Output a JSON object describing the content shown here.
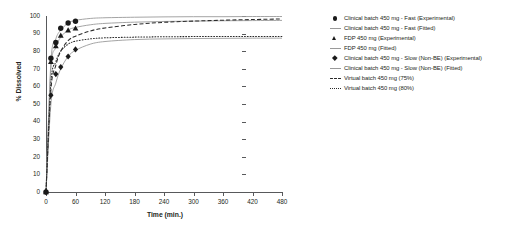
{
  "chart_data": {
    "type": "line",
    "title": "",
    "xlabel": "Time (min.)",
    "ylabel": "% Dissolved",
    "xlim": [
      0,
      480
    ],
    "ylim": [
      0,
      100
    ],
    "xticks": [
      0,
      60,
      120,
      180,
      240,
      300,
      360,
      420,
      480
    ],
    "yticks": [
      0,
      10,
      20,
      30,
      40,
      50,
      60,
      70,
      80,
      90,
      100
    ],
    "grid": false,
    "legend_position": "right",
    "series": [
      {
        "name": "Clinical batch 450 mg - Fast (Experimental)",
        "marker": "circle",
        "style": "markers",
        "color": "#1a1a1a",
        "x": [
          0,
          10,
          20,
          30,
          45,
          60
        ],
        "y": [
          0,
          76,
          85,
          93,
          96,
          97
        ]
      },
      {
        "name": "Clinical batch 450 mg - Fast (Fitted)",
        "marker": "none",
        "style": "solid",
        "color": "#9a9a9a",
        "x": [
          0,
          10,
          20,
          30,
          45,
          60,
          90,
          120,
          180,
          240,
          300,
          360,
          420,
          480
        ],
        "y": [
          0,
          74,
          87,
          92,
          96,
          97.5,
          98.6,
          99,
          99.3,
          99.5,
          99.6,
          99.6,
          99.7,
          99.7
        ]
      },
      {
        "name": "FDP 450 mg (Experimental)",
        "marker": "triangle",
        "style": "markers",
        "color": "#1a1a1a",
        "x": [
          0,
          10,
          20,
          30,
          45,
          60
        ],
        "y": [
          0,
          74,
          83,
          89,
          92,
          93
        ]
      },
      {
        "name": "FDP 450 mg (Fitted)",
        "marker": "none",
        "style": "solid",
        "color": "#9a9a9a",
        "x": [
          0,
          10,
          20,
          30,
          45,
          60,
          90,
          120,
          180,
          240,
          300,
          360,
          420,
          480
        ],
        "y": [
          0,
          70,
          82,
          88,
          92,
          93.5,
          95,
          95.8,
          96.5,
          96.9,
          97.1,
          97.3,
          97.4,
          97.5
        ]
      },
      {
        "name": "Clinical batch 450 mg - Slow (Non-BE) (Experimental)",
        "marker": "diamond",
        "style": "markers",
        "color": "#1a1a1a",
        "x": [
          0,
          10,
          20,
          30,
          45,
          60
        ],
        "y": [
          0,
          55,
          67,
          71,
          77,
          81
        ]
      },
      {
        "name": "Clinical batch 450 mg - Slow (Non-BE) (Fitted)",
        "marker": "none",
        "style": "solid",
        "color": "#9a9a9a",
        "x": [
          0,
          10,
          20,
          30,
          45,
          60,
          90,
          120,
          180,
          240,
          300,
          360,
          420,
          480
        ],
        "y": [
          0,
          50,
          62,
          70,
          77,
          80.5,
          84,
          85.5,
          86.6,
          87,
          87.2,
          87.3,
          87.4,
          87.4
        ]
      },
      {
        "name": "Virtual batch 450 mg (75%)",
        "marker": "none",
        "style": "dashed",
        "color": "#2b2b2b",
        "x": [
          0,
          10,
          20,
          30,
          45,
          60,
          90,
          120,
          180,
          240,
          300,
          360,
          420,
          480
        ],
        "y": [
          0,
          58,
          72,
          80,
          86,
          88.5,
          91.5,
          93.2,
          95.2,
          96.4,
          97.1,
          97.6,
          98,
          98.3
        ]
      },
      {
        "name": "Virtual batch 450 mg (80%)",
        "marker": "none",
        "style": "dotted",
        "color": "#2b2b2b",
        "x": [
          0,
          10,
          20,
          30,
          45,
          60,
          90,
          120,
          180,
          240,
          300,
          360,
          420,
          480
        ],
        "y": [
          0,
          62,
          74,
          80,
          84,
          85.7,
          87,
          87.6,
          88,
          88.2,
          88.3,
          88.3,
          88.4,
          88.4
        ]
      }
    ]
  },
  "legend": {
    "items": [
      {
        "key": "circle",
        "label": "Clinical batch 450 mg - Fast (Experimental)"
      },
      {
        "key": "solid",
        "label": "Clinical batch 450 mg - Fast (Fitted)"
      },
      {
        "key": "triangle",
        "label": "FDP 450 mg (Experimental)"
      },
      {
        "key": "solid",
        "label": "FDP 450 mg (Fitted)"
      },
      {
        "key": "diamond",
        "label": "Clinical batch 450 mg - Slow (Non-BE) (Experimental)"
      },
      {
        "key": "solid",
        "label": "Clinical batch 450 mg - Slow (Non-BE) (Fitted)"
      },
      {
        "key": "dashed",
        "label": "Virtual batch 450 mg (75%)"
      },
      {
        "key": "dotted",
        "label": "Virtual batch 450 mg (80%)"
      }
    ]
  },
  "colors": {
    "fitted_line": "#9a9a9a",
    "virtual_line": "#2b2b2b",
    "marker": "#1a1a1a",
    "axis": "#58595b"
  }
}
